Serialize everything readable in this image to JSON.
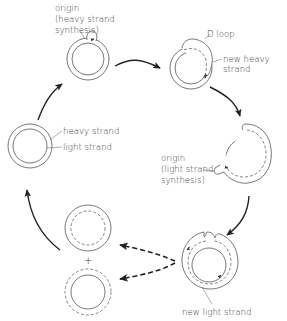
{
  "diagram": {
    "stages": [
      {
        "id": "stage-1-origin-heavy",
        "labels": [
          "origin",
          "(heavy strand",
          "synthesis)"
        ]
      },
      {
        "id": "stage-2-d-loop",
        "labels": [
          "D loop",
          "new heavy",
          "strand"
        ]
      },
      {
        "id": "stage-3-origin-light",
        "labels": [
          "origin",
          "(light strand",
          "synthesis)"
        ]
      },
      {
        "id": "stage-4-new-light",
        "labels": [
          "new light strand"
        ]
      },
      {
        "id": "stage-5-daughters",
        "labels": [
          "+"
        ]
      },
      {
        "id": "stage-6-parent",
        "labels": [
          "heavy strand",
          "light strand"
        ]
      }
    ],
    "labels": {
      "origin_heavy_1": "origin",
      "origin_heavy_2": "(heavy strand",
      "origin_heavy_3": "synthesis)",
      "d_loop": "D loop",
      "new_heavy_1": "new heavy",
      "new_heavy_2": "strand",
      "origin_light_1": "origin",
      "origin_light_2": "(light strand",
      "origin_light_3": "synthesis)",
      "new_light": "new light strand",
      "heavy_strand": "heavy strand",
      "light_strand": "light strand",
      "plus": "+"
    },
    "colors": {
      "line": "#555555",
      "arrow": "#222222",
      "text": "#3a3a3a",
      "background": "#ffffff"
    }
  }
}
